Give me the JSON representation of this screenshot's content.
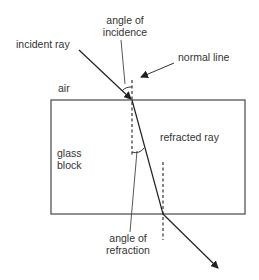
{
  "diagram": {
    "type": "refraction through a glass block",
    "labels": {
      "incident_ray": "incident ray",
      "angle_of_incidence_line1": "angle of",
      "angle_of_incidence_line2": "incidence",
      "normal_line": "normal line",
      "air": "air",
      "glass_block_line1": "glass",
      "glass_block_line2": "block",
      "refracted_ray": "refracted ray",
      "angle_of_refraction_line1": "angle of",
      "angle_of_refraction_line2": "refraction"
    },
    "colors": {
      "stroke": "#333333",
      "block_stroke": "#555555",
      "background": "#ffffff"
    }
  }
}
